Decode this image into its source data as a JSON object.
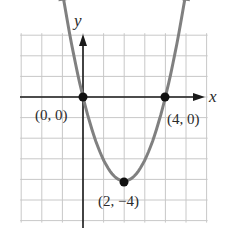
{
  "chart_data": {
    "type": "line",
    "title": "",
    "xlabel": "x",
    "ylabel": "y",
    "xlim": [
      -3,
      6
    ],
    "ylim": [
      -6,
      3
    ],
    "grid": true,
    "function": "y = x^2 - 4x",
    "series": [
      {
        "name": "parabola",
        "x": [
          -0.9,
          0,
          1,
          2,
          3,
          4,
          4.9
        ],
        "y": [
          4.41,
          0,
          -3,
          -4,
          -3,
          0,
          4.41
        ]
      }
    ],
    "points": [
      {
        "x": 0,
        "y": 0,
        "label": "(0, 0)"
      },
      {
        "x": 4,
        "y": 0,
        "label": "(4, 0)"
      },
      {
        "x": 2,
        "y": -4,
        "label": "(2, −4)"
      }
    ]
  },
  "labels": {
    "x_axis": "x",
    "y_axis": "y",
    "p1": "(0, 0)",
    "p2": "(4, 0)",
    "p3": "(2, −4)"
  },
  "colors": {
    "grid": "#c8c8c8",
    "axis": "#1a1a1a",
    "curve": "#808080",
    "point": "#111111"
  }
}
